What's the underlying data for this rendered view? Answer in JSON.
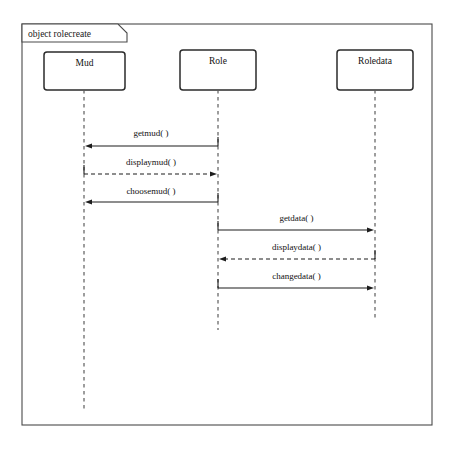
{
  "diagram": {
    "type": "uml-sequence-diagram",
    "frame": {
      "label": "object rolecreate",
      "x": 22,
      "y": 24,
      "width": 410,
      "height": 401,
      "tab_width": 96,
      "tab_height": 18
    },
    "colors": {
      "background": "#ffffff",
      "frame_stroke": "#4a4a4a",
      "box_stroke": "#2b2b2b",
      "lifeline_stroke": "#5d5d5d",
      "message_stroke": "#1d1d1d",
      "text": "#111111"
    },
    "lifelines": [
      {
        "id": "mud",
        "name": "Mud",
        "box_x": 44,
        "box_y": 52,
        "box_width": 81,
        "box_height": 38,
        "center_x": 84,
        "stem_end_y": 412
      },
      {
        "id": "role",
        "name": "Role",
        "box_x": 180,
        "box_y": 50,
        "box_width": 76,
        "box_height": 40,
        "center_x": 218,
        "stem_end_y": 330
      },
      {
        "id": "roledata",
        "name": "Roledata",
        "box_x": 337,
        "box_y": 50,
        "box_width": 76,
        "box_height": 40,
        "center_x": 375,
        "stem_end_y": 318
      }
    ],
    "messages": [
      {
        "id": "m1",
        "label": "getmud( )",
        "from": "role",
        "to": "mud",
        "direction": "left",
        "style": "solid",
        "y": 146,
        "label_y": 136
      },
      {
        "id": "m2",
        "label": "displaymud( )",
        "from": "mud",
        "to": "role",
        "direction": "right",
        "style": "dashed",
        "y": 174,
        "label_y": 165
      },
      {
        "id": "m3",
        "label": "choosemud( )",
        "from": "role",
        "to": "mud",
        "direction": "left",
        "style": "solid",
        "y": 202,
        "label_y": 194
      },
      {
        "id": "m4",
        "label": "getdata( )",
        "from": "role",
        "to": "roledata",
        "direction": "right",
        "style": "solid",
        "y": 230,
        "label_y": 221
      },
      {
        "id": "m5",
        "label": "displaydata( )",
        "from": "roledata",
        "to": "role",
        "direction": "left",
        "style": "dashed",
        "y": 259,
        "label_y": 250
      },
      {
        "id": "m6",
        "label": "changedata( )",
        "from": "role",
        "to": "roledata",
        "direction": "right",
        "style": "solid",
        "y": 288,
        "label_y": 279
      }
    ]
  }
}
